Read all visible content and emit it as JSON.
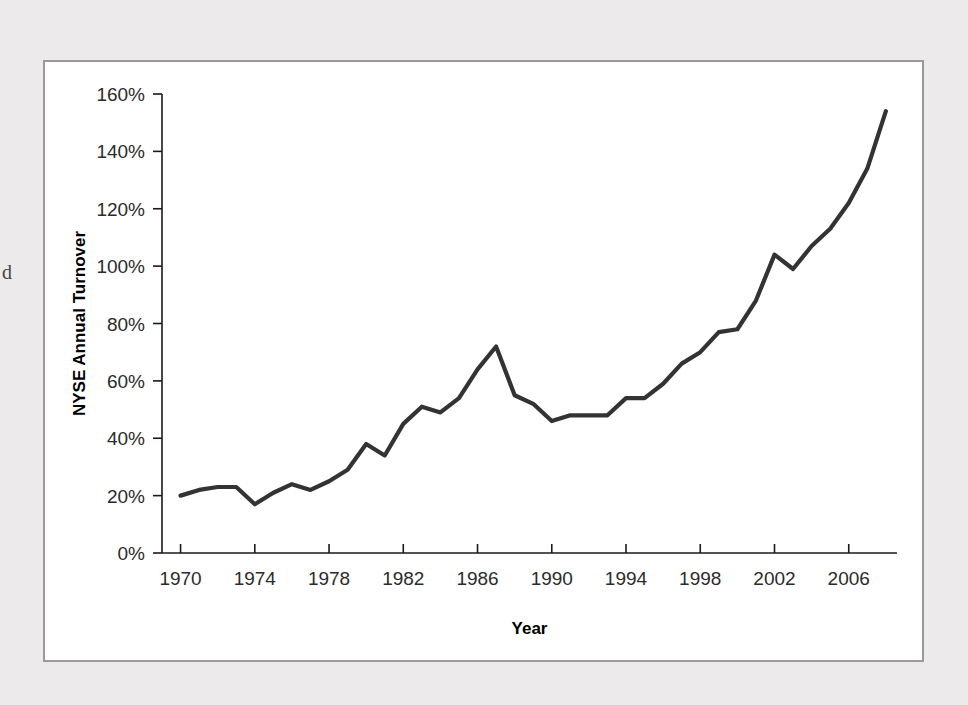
{
  "figure": {
    "background_color": "#eceaea",
    "panel_color": "#ffffff",
    "border_color": "#9a9a9a",
    "line_color": "#333333",
    "page_bleed_glyph": "d"
  },
  "chart_data": {
    "type": "line",
    "title": "",
    "xlabel": "Year",
    "ylabel": "NYSE Annual Turnover",
    "xlim": [
      1969,
      2008.6
    ],
    "ylim": [
      0,
      160
    ],
    "grid": false,
    "legend": null,
    "y_tick_labels": [
      "0%",
      "20%",
      "40%",
      "60%",
      "80%",
      "100%",
      "120%",
      "140%",
      "160%"
    ],
    "y_ticks": [
      0,
      20,
      40,
      60,
      80,
      100,
      120,
      140,
      160
    ],
    "x_tick_labels": [
      "1970",
      "1974",
      "1978",
      "1982",
      "1986",
      "1990",
      "1994",
      "1998",
      "2002",
      "2006"
    ],
    "x_ticks": [
      1970,
      1974,
      1978,
      1982,
      1986,
      1990,
      1994,
      1998,
      2002,
      2006
    ],
    "x": [
      1970,
      1971,
      1972,
      1973,
      1974,
      1975,
      1976,
      1977,
      1978,
      1979,
      1980,
      1981,
      1982,
      1983,
      1984,
      1985,
      1986,
      1987,
      1988,
      1989,
      1990,
      1991,
      1992,
      1993,
      1994,
      1995,
      1996,
      1997,
      1998,
      1999,
      2000,
      2001,
      2002,
      2003,
      2004,
      2005,
      2006,
      2007,
      2008
    ],
    "values": [
      20,
      22,
      23,
      23,
      17,
      21,
      24,
      22,
      25,
      29,
      38,
      34,
      45,
      51,
      49,
      54,
      64,
      72,
      55,
      52,
      46,
      48,
      48,
      48,
      54,
      54,
      59,
      66,
      70,
      77,
      78,
      88,
      104,
      99,
      107,
      113,
      122,
      134,
      154
    ],
    "series_name": "NYSE Annual Turnover"
  }
}
